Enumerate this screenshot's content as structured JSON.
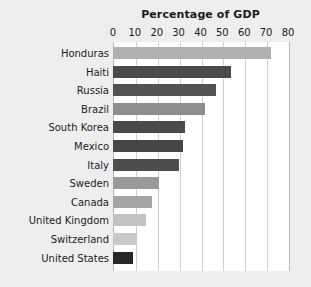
{
  "chart_data": {
    "type": "bar",
    "orientation": "horizontal",
    "title": "Percentage of GDP",
    "xlabel": "",
    "ylabel": "",
    "xlim": [
      0,
      80
    ],
    "xticks": [
      0,
      10,
      20,
      30,
      40,
      50,
      60,
      70,
      80
    ],
    "grid": true,
    "legend": false,
    "categories": [
      "Honduras",
      "Haiti",
      "Russia",
      "Brazil",
      "South Korea",
      "Mexico",
      "Italy",
      "Sweden",
      "Canada",
      "United Kingdom",
      "Switzerland",
      "United States"
    ],
    "values": [
      72,
      54,
      47,
      42,
      33,
      32,
      30,
      21,
      18,
      15,
      11,
      9
    ],
    "bar_colors": [
      "#b0b0b0",
      "#4a4a4a",
      "#525252",
      "#8e8e8e",
      "#4a4a4a",
      "#464646",
      "#4d4d4d",
      "#9a9a9a",
      "#a5a5a5",
      "#c2c2c2",
      "#c9c9c9",
      "#262626"
    ]
  },
  "style": {
    "page_background": "#eeeeee",
    "plot_background": "#ffffff",
    "gridline_color": "#cfcfcf",
    "axis_border_color": "#b9b9b9",
    "text_color": "#1b1b1b"
  }
}
